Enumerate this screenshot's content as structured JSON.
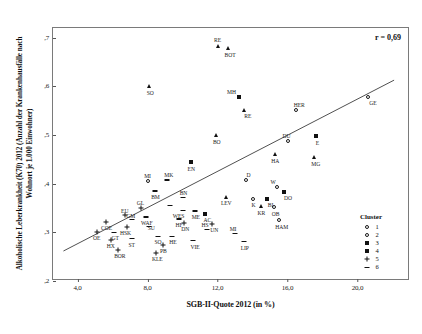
{
  "chart_data": {
    "type": "scatter",
    "title": "",
    "xlabel": "SGB-II-Quote 2012 (in %)",
    "ylabel": "Alkoholische Leberkrankheit (K70) 2012 (Anzahl der Krankenhausfälle nach Wohnort je 1.000 Einwohner)",
    "xlim": [
      2.6,
      23.0
    ],
    "ylim": [
      0.2,
      0.72
    ],
    "xticks": [
      "4,0",
      "8,0",
      "12,0",
      "16,0",
      "20,0"
    ],
    "xtickvals": [
      4.0,
      8.0,
      12.0,
      16.0,
      20.0
    ],
    "yticks": [
      ",7",
      ",6",
      ",5",
      ",4",
      ",3",
      ",2"
    ],
    "ytickvals": [
      0.7,
      0.6,
      0.5,
      0.4,
      0.3,
      0.2
    ],
    "grid": false,
    "annotation": "r = 0,69",
    "trendline": {
      "x0": 3.2,
      "y0": 0.258,
      "x1": 22.2,
      "y1": 0.612
    },
    "legend": {
      "title": "Cluster",
      "position": "bottom-right",
      "entries": [
        {
          "label": "1",
          "marker": "open-circle"
        },
        {
          "label": "2",
          "marker": "open-circle-small"
        },
        {
          "label": "3",
          "marker": "filled-square"
        },
        {
          "label": "4",
          "marker": "filled-square"
        },
        {
          "label": "5",
          "marker": "plus"
        },
        {
          "label": "6",
          "marker": "dash"
        }
      ]
    },
    "points": [
      {
        "label": "RE",
        "x": 12.0,
        "y": 0.682,
        "cluster": 4,
        "marker": "triangle",
        "lx": 0,
        "ly": -9
      },
      {
        "label": "BOT",
        "x": 12.6,
        "y": 0.678,
        "cluster": 4,
        "marker": "triangle",
        "lx": 2,
        "ly": 4
      },
      {
        "label": "SO",
        "x": 8.1,
        "y": 0.601,
        "cluster": 4,
        "marker": "triangle",
        "lx": 1,
        "ly": 4
      },
      {
        "label": "MH",
        "x": 13.2,
        "y": 0.578,
        "cluster": 4,
        "marker": "filled-square",
        "lx": -7,
        "ly": -8
      },
      {
        "label": "RE",
        "x": 13.5,
        "y": 0.552,
        "cluster": 4,
        "marker": "triangle",
        "lx": 4,
        "ly": 3
      },
      {
        "label": "HER",
        "x": 16.5,
        "y": 0.552,
        "cluster": 1,
        "marker": "open-circle",
        "lx": 3,
        "ly": -8
      },
      {
        "label": "BO",
        "x": 11.9,
        "y": 0.5,
        "cluster": 4,
        "marker": "triangle",
        "lx": 1,
        "ly": 4
      },
      {
        "label": "GE",
        "x": 20.6,
        "y": 0.578,
        "cluster": 1,
        "marker": "open-circle",
        "lx": 5,
        "ly": 3
      },
      {
        "label": "DU",
        "x": 16.0,
        "y": 0.487,
        "cluster": 1,
        "marker": "open-circle",
        "lx": -1,
        "ly": -8
      },
      {
        "label": "E",
        "x": 17.6,
        "y": 0.499,
        "cluster": 4,
        "marker": "filled-square",
        "lx": 2,
        "ly": 4
      },
      {
        "label": "HA",
        "x": 15.3,
        "y": 0.462,
        "cluster": 4,
        "marker": "triangle",
        "lx": 0,
        "ly": 4
      },
      {
        "label": "MG",
        "x": 17.5,
        "y": 0.455,
        "cluster": 4,
        "marker": "triangle",
        "lx": 2,
        "ly": 4
      },
      {
        "label": "EN",
        "x": 10.5,
        "y": 0.445,
        "cluster": 4,
        "marker": "filled-square",
        "lx": 0,
        "ly": 4
      },
      {
        "label": "MI",
        "x": 8.0,
        "y": 0.405,
        "cluster": 1,
        "marker": "open-circle",
        "lx": 0,
        "ly": -8
      },
      {
        "label": "MK",
        "x": 9.1,
        "y": 0.408,
        "cluster": 6,
        "marker": "dash",
        "lx": 2,
        "ly": -8
      },
      {
        "label": "D",
        "x": 13.6,
        "y": 0.408,
        "cluster": 1,
        "marker": "open-circle",
        "lx": 3,
        "ly": -8
      },
      {
        "label": "W",
        "x": 15.4,
        "y": 0.394,
        "cluster": 1,
        "marker": "open-circle",
        "lx": -4,
        "ly": -8
      },
      {
        "label": "DO",
        "x": 15.8,
        "y": 0.383,
        "cluster": 4,
        "marker": "filled-square",
        "lx": 4,
        "ly": 3
      },
      {
        "label": "BM",
        "x": 8.4,
        "y": 0.385,
        "cluster": 6,
        "marker": "dash",
        "lx": 1,
        "ly": 3
      },
      {
        "label": "BN",
        "x": 10.0,
        "y": 0.372,
        "cluster": 6,
        "marker": "dash",
        "lx": 1,
        "ly": -7
      },
      {
        "label": "LEV",
        "x": 12.5,
        "y": 0.372,
        "cluster": 4,
        "marker": "triangle",
        "lx": 0,
        "ly": 3
      },
      {
        "label": "K",
        "x": 14.0,
        "y": 0.368,
        "cluster": 1,
        "marker": "open-circle",
        "lx": 1,
        "ly": 3
      },
      {
        "label": "BI",
        "x": 14.8,
        "y": 0.368,
        "cluster": 4,
        "marker": "filled-square",
        "lx": 4,
        "ly": 3
      },
      {
        "label": "KR",
        "x": 14.5,
        "y": 0.354,
        "cluster": 4,
        "marker": "triangle",
        "lx": 0,
        "ly": 4
      },
      {
        "label": "OB",
        "x": 15.2,
        "y": 0.352,
        "cluster": 1,
        "marker": "open-circle",
        "lx": 2,
        "ly": 4
      },
      {
        "label": "HAM",
        "x": 15.5,
        "y": 0.326,
        "cluster": 1,
        "marker": "open-circle",
        "lx": 3,
        "ly": 4
      },
      {
        "label": "GL",
        "x": 7.6,
        "y": 0.35,
        "cluster": 5,
        "marker": "plus",
        "lx": 0,
        "ly": -8
      },
      {
        "label": "WES",
        "x": 10.0,
        "y": 0.345,
        "cluster": 6,
        "marker": "dash",
        "lx": -4,
        "ly": 3
      },
      {
        "label": "ME",
        "x": 10.7,
        "y": 0.344,
        "cluster": 6,
        "marker": "dash",
        "lx": 1,
        "ly": 3
      },
      {
        "label": "EU",
        "x": 6.7,
        "y": 0.335,
        "cluster": 5,
        "marker": "plus",
        "lx": 0,
        "ly": -7
      },
      {
        "label": "WAF",
        "x": 7.9,
        "y": 0.332,
        "cluster": 6,
        "marker": "dash",
        "lx": 1,
        "ly": 3
      },
      {
        "label": "HF",
        "x": 9.8,
        "y": 0.328,
        "cluster": 6,
        "marker": "dash",
        "lx": 0,
        "ly": 3
      },
      {
        "label": "GM",
        "x": 7.1,
        "y": 0.326,
        "cluster": 6,
        "marker": "dash",
        "lx": -1,
        "ly": -7
      },
      {
        "label": "COE",
        "x": 5.6,
        "y": 0.322,
        "cluster": 5,
        "marker": "plus",
        "lx": 1,
        "ly": 3
      },
      {
        "label": "HSK",
        "x": 6.8,
        "y": 0.312,
        "cluster": 5,
        "marker": "plus",
        "lx": -1,
        "ly": 3
      },
      {
        "label": "SU",
        "x": 8.1,
        "y": 0.312,
        "cluster": 6,
        "marker": "dash",
        "lx": 2,
        "ly": -2
      },
      {
        "label": "OE",
        "x": 5.1,
        "y": 0.301,
        "cluster": 5,
        "marker": "plus",
        "lx": 0,
        "ly": 3
      },
      {
        "label": "GT",
        "x": 6.1,
        "y": 0.3,
        "cluster": 6,
        "marker": "dash",
        "lx": 1,
        "ly": 3
      },
      {
        "label": "HS",
        "x": 11.4,
        "y": 0.306,
        "cluster": 6,
        "marker": "dash",
        "lx": -2,
        "ly": -7
      },
      {
        "label": "MI",
        "x": 13.0,
        "y": 0.298,
        "cluster": 6,
        "marker": "dash",
        "lx": -2,
        "ly": -7
      },
      {
        "label": "HX",
        "x": 5.9,
        "y": 0.285,
        "cluster": 5,
        "marker": "plus",
        "lx": 0,
        "ly": 3
      },
      {
        "label": "ST",
        "x": 7.1,
        "y": 0.287,
        "cluster": 6,
        "marker": "dash",
        "lx": 0,
        "ly": 3
      },
      {
        "label": "SO",
        "x": 8.6,
        "y": 0.292,
        "cluster": 6,
        "marker": "dash",
        "lx": 0,
        "ly": 3
      },
      {
        "label": "HE",
        "x": 9.4,
        "y": 0.292,
        "cluster": 6,
        "marker": "dash",
        "lx": 1,
        "ly": 3
      },
      {
        "label": "VIE",
        "x": 10.6,
        "y": 0.283,
        "cluster": 6,
        "marker": "dash",
        "lx": 2,
        "ly": 3
      },
      {
        "label": "LIP",
        "x": 13.5,
        "y": 0.281,
        "cluster": 6,
        "marker": "dash",
        "lx": 1,
        "ly": 3
      },
      {
        "label": "PB",
        "x": 8.9,
        "y": 0.274,
        "cluster": 5,
        "marker": "plus",
        "lx": 0,
        "ly": 3
      },
      {
        "label": "BOR",
        "x": 6.3,
        "y": 0.264,
        "cluster": 5,
        "marker": "plus",
        "lx": 2,
        "ly": 3
      },
      {
        "label": "KLE",
        "x": 8.5,
        "y": 0.258,
        "cluster": 5,
        "marker": "plus",
        "lx": 1,
        "ly": 3
      },
      {
        "label": "AC",
        "x": 11.3,
        "y": 0.338,
        "cluster": 4,
        "marker": "filled-square",
        "lx": 2,
        "ly": 3
      },
      {
        "label": "DN",
        "x": 10.1,
        "y": 0.32,
        "cluster": 5,
        "marker": "plus",
        "lx": 1,
        "ly": 3
      },
      {
        "label": "UN",
        "x": 11.7,
        "y": 0.317,
        "cluster": 5,
        "marker": "plus",
        "lx": 2,
        "ly": 3
      },
      {
        "label": "MI2",
        "x": 9.3,
        "y": 0.355,
        "cluster": 6,
        "marker": "dash",
        "lx": -3,
        "ly": 3
      }
    ]
  }
}
